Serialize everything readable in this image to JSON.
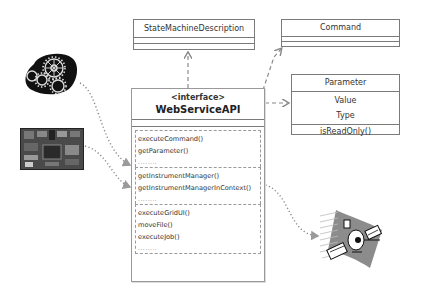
{
  "diagram": {
    "type": "uml-class",
    "classes": {
      "state_machine": {
        "name": "StateMachineDescription"
      },
      "command": {
        "name": "Command"
      },
      "parameter": {
        "name": "Parameter",
        "attributes": [
          "Value",
          "Type"
        ],
        "operations": [
          "isReadOnly()"
        ]
      },
      "web_service_api": {
        "stereotype": "<interface>",
        "name": "WebServiceAPI",
        "groups": [
          {
            "methods": [
              "executeCommand()",
              "getParameter()"
            ],
            "ellipsis": "........"
          },
          {
            "methods": [
              "getInstrumentManager()",
              "getInstrumentManagerInContext()"
            ],
            "ellipsis": "........"
          },
          {
            "methods": [
              "executeGridUI()",
              "moveFile()",
              "executeJob()"
            ],
            "ellipsis": "........"
          }
        ]
      }
    },
    "images": {
      "gears": "gears-icon",
      "circuit_board": "circuit-board-image",
      "satellite": "satellite-icon"
    },
    "relations": [
      {
        "from": "WebServiceAPI",
        "to": "StateMachineDescription",
        "style": "dashed-arrow"
      },
      {
        "from": "WebServiceAPI",
        "to": "Command",
        "style": "dashed-arrow"
      },
      {
        "from": "WebServiceAPI",
        "to": "Parameter",
        "style": "dashed-arrow"
      },
      {
        "from": "gears",
        "to": "WebServiceAPI.group1",
        "style": "dotted-arrow"
      },
      {
        "from": "circuit_board",
        "to": "WebServiceAPI.group2",
        "style": "dotted-arrow"
      },
      {
        "from": "WebServiceAPI.group2",
        "to": "satellite",
        "style": "dotted-arrow"
      }
    ],
    "colors": {
      "box_border": "#7a7a7a",
      "connector": "#8a8a8a",
      "text": "#333333"
    }
  }
}
